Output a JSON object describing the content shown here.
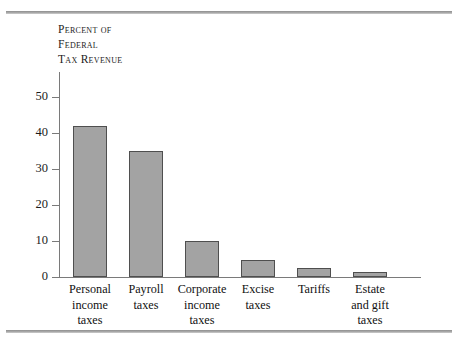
{
  "figure": {
    "axis_title_lines": [
      "Percent of",
      "Federal",
      "Tax Revenue"
    ],
    "bar_fill_color": "#a3a3a3",
    "bar_border_color": "#4f4f4f",
    "rule_color": "#9a9a9a",
    "axis_color": "#7a7a7a"
  },
  "chart_data": {
    "type": "bar",
    "title": "",
    "xlabel": "",
    "ylabel": "Percent of Federal Tax Revenue",
    "ylim": [
      0,
      55
    ],
    "yticks": [
      0,
      10,
      20,
      30,
      40,
      50
    ],
    "ytick_labels": [
      "0",
      "10",
      "20",
      "30",
      "40",
      "50"
    ],
    "grid": false,
    "legend": "none",
    "categories": [
      "Personal income taxes",
      "Payroll taxes",
      "Corporate income taxes",
      "Excise taxes",
      "Tariffs",
      "Estate and gift taxes"
    ],
    "category_lines": [
      [
        "Personal",
        "income",
        "taxes"
      ],
      [
        "Payroll",
        "taxes"
      ],
      [
        "Corporate",
        "income",
        "taxes"
      ],
      [
        "Excise",
        "taxes"
      ],
      [
        "Tariffs"
      ],
      [
        "Estate",
        "and gift",
        "taxes"
      ]
    ],
    "values": [
      42,
      35,
      10,
      4.7,
      2.6,
      1.4
    ]
  }
}
